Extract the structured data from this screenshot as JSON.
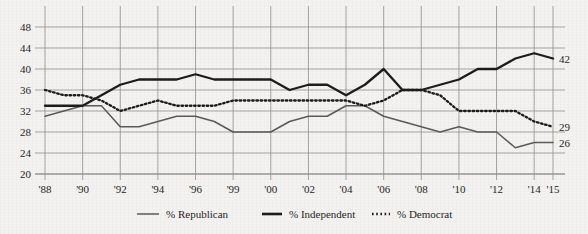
{
  "chart_data": {
    "type": "line",
    "title": "",
    "subtitle": "",
    "xlabel": "",
    "ylabel": "",
    "ylim": [
      20,
      48
    ],
    "xlim": [
      1988,
      2015
    ],
    "grid": true,
    "legend_position": "bottom",
    "y_ticks": [
      "20",
      "24",
      "28",
      "32",
      "36",
      "40",
      "44",
      "48"
    ],
    "y_tick_values": [
      20,
      24,
      28,
      32,
      36,
      40,
      44,
      48
    ],
    "x_ticks": [
      "'88",
      "'90",
      "'92",
      "'94",
      "'96",
      "'99",
      "'00",
      "'02",
      "'04",
      "'06",
      "'08",
      "'10",
      "'12",
      "'14",
      "'15"
    ],
    "x_tick_values": [
      1988,
      1990,
      1992,
      1994,
      1996,
      1998,
      2000,
      2002,
      2004,
      2006,
      2008,
      2010,
      2012,
      2014,
      2015
    ],
    "x": [
      1988,
      1989,
      1990,
      1991,
      1992,
      1993,
      1994,
      1995,
      1996,
      1997,
      1998,
      1999,
      2000,
      2001,
      2002,
      2003,
      2004,
      2005,
      2006,
      2007,
      2008,
      2009,
      2010,
      2011,
      2012,
      2013,
      2014,
      2015
    ],
    "series": [
      {
        "name": "% Republican",
        "style": "thin-solid",
        "color": "#5a5a5a",
        "end_label": "26",
        "values": [
          31,
          32,
          33,
          33,
          29,
          29,
          30,
          31,
          31,
          30,
          28,
          28,
          28,
          30,
          31,
          31,
          33,
          33,
          31,
          30,
          29,
          28,
          29,
          28,
          28,
          25,
          26,
          26
        ]
      },
      {
        "name": "% Independent",
        "style": "thick-solid",
        "color": "#1c1c1c",
        "end_label": "42",
        "values": [
          33,
          33,
          33,
          35,
          37,
          38,
          38,
          38,
          39,
          38,
          38,
          38,
          38,
          36,
          37,
          37,
          35,
          37,
          40,
          36,
          36,
          37,
          38,
          40,
          40,
          42,
          43,
          42
        ]
      },
      {
        "name": "% Democrat",
        "style": "dotted",
        "color": "#1c1c1c",
        "end_label": "29",
        "values": [
          36,
          35,
          35,
          34,
          32,
          33,
          34,
          33,
          33,
          33,
          34,
          34,
          34,
          34,
          34,
          34,
          34,
          33,
          34,
          36,
          36,
          35,
          32,
          32,
          32,
          32,
          30,
          29
        ]
      }
    ],
    "annotations": [
      {
        "name": "end-label-independent",
        "text": "42",
        "value": 42
      },
      {
        "name": "end-label-democrat",
        "text": "29",
        "value": 29
      },
      {
        "name": "end-label-republican",
        "text": "26",
        "value": 26
      }
    ]
  },
  "legend": {
    "items": [
      {
        "label": "% Republican",
        "marker": "thin-line-marker"
      },
      {
        "label": "% Independent",
        "marker": "thick-line-marker"
      },
      {
        "label": "% Democrat",
        "marker": "dotted-line-marker"
      }
    ]
  },
  "colors": {
    "background": "#f3f2f0",
    "grid": "#8f8f8f",
    "axis": "#6b6b6b",
    "republican": "#5a5a5a",
    "independent": "#1c1c1c",
    "democrat": "#1c1c1c",
    "text": "#262626"
  }
}
